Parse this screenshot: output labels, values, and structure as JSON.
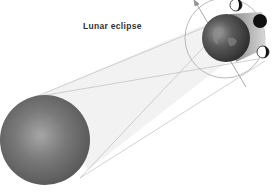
{
  "diagram": {
    "title": "Lunar eclipse",
    "objects": [
      {
        "name": "Sun",
        "shape": "sphere",
        "color": "#6a6a6a"
      },
      {
        "name": "Earth",
        "shape": "sphere",
        "color": "#4a4a4a"
      },
      {
        "name": "Moon positions",
        "count": 3
      },
      {
        "name": "Moon orbit",
        "shape": "circle"
      }
    ],
    "colors": {
      "background": "#ffffff",
      "lines": "#b0b0b0",
      "sun_dark": "#5a5a5a",
      "sun_light": "#a8a8a8",
      "earth": "#3e3e3e",
      "moon_dark": "#111111"
    }
  }
}
